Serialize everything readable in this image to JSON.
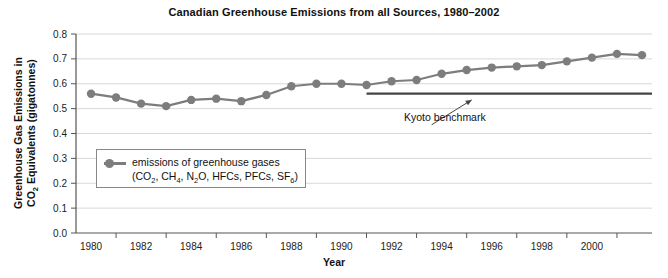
{
  "chart_data": {
    "type": "line",
    "title": "Canadian Greenhouse Emissions from all Sources, 1980–2002",
    "xlabel": "Year",
    "ylabel_line1": "Greenhouse Gas Emissions in",
    "ylabel_line2_pre": "CO",
    "ylabel_line2_sub": "2",
    "ylabel_line2_post": " Equivalents (gigatonnes)",
    "x": [
      1980,
      1981,
      1982,
      1983,
      1984,
      1985,
      1986,
      1987,
      1988,
      1989,
      1990,
      1991,
      1992,
      1993,
      1994,
      1995,
      1996,
      1997,
      1998,
      1999,
      2000,
      2001,
      2002
    ],
    "values": [
      0.56,
      0.545,
      0.52,
      0.51,
      0.535,
      0.54,
      0.53,
      0.555,
      0.59,
      0.6,
      0.6,
      0.595,
      0.61,
      0.615,
      0.64,
      0.655,
      0.665,
      0.67,
      0.675,
      0.69,
      0.705,
      0.72,
      0.715
    ],
    "series": [
      {
        "name": "emissions of greenhouse gases",
        "values": [
          0.56,
          0.545,
          0.52,
          0.51,
          0.535,
          0.54,
          0.53,
          0.555,
          0.59,
          0.6,
          0.6,
          0.595,
          0.61,
          0.615,
          0.64,
          0.655,
          0.665,
          0.67,
          0.675,
          0.69,
          0.705,
          0.72,
          0.715
        ]
      }
    ],
    "xlim": [
      1979.4,
      2002.4
    ],
    "ylim": [
      0.0,
      0.8
    ],
    "yticks": [
      "0.0",
      "0.1",
      "0.2",
      "0.3",
      "0.4",
      "0.5",
      "0.6",
      "0.7",
      "0.8"
    ],
    "ytick_values": [
      0.0,
      0.1,
      0.2,
      0.3,
      0.4,
      0.5,
      0.6,
      0.7,
      0.8
    ],
    "xticks": [
      "1980",
      "1982",
      "1984",
      "1986",
      "1988",
      "1990",
      "1992",
      "1994",
      "1996",
      "1998",
      "2000"
    ],
    "xtick_values": [
      1980,
      1982,
      1984,
      1986,
      1988,
      1990,
      1992,
      1994,
      1996,
      1998,
      2000
    ],
    "grid": true,
    "grid_axis": "y",
    "legend_position": "lower-left-inside",
    "series_color": "#7d7d7d",
    "grid_color": "#d8d8d8",
    "axis_color": "#555555",
    "annotations": [
      {
        "name": "kyoto-benchmark",
        "label": "Kyoto benchmark",
        "type": "horizontal-line-with-arrow",
        "y_value": 0.56,
        "x_start": 1991.0,
        "x_end": 2002.4,
        "color": "#444444",
        "arrow_from_x": 1993.6,
        "arrow_from_y": 0.435,
        "arrow_to_x": 1995.2,
        "arrow_to_y": 0.535
      }
    ]
  },
  "legend": {
    "marker_name": "emissions-marker",
    "line1": "emissions of greenhouse gases",
    "line2_parts": [
      {
        "t": "(CO",
        "sub": false
      },
      {
        "t": "2",
        "sub": true
      },
      {
        "t": ", CH",
        "sub": false
      },
      {
        "t": "4",
        "sub": true
      },
      {
        "t": ", N",
        "sub": false
      },
      {
        "t": "2",
        "sub": true
      },
      {
        "t": "O, HFCs, PFCs, SF",
        "sub": false
      },
      {
        "t": "6",
        "sub": true
      },
      {
        "t": ")",
        "sub": false
      }
    ]
  }
}
